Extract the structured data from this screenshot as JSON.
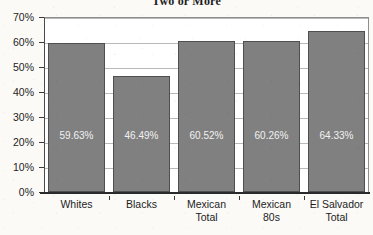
{
  "chart_data": {
    "type": "bar",
    "title": "Two or More",
    "xlabel": "",
    "ylabel": "",
    "ylim": [
      0,
      70
    ],
    "ytick_labels": [
      "0%",
      "10%",
      "20%",
      "30%",
      "40%",
      "50%",
      "60%",
      "70%"
    ],
    "ytick_values": [
      0,
      10,
      20,
      30,
      40,
      50,
      60,
      70
    ],
    "grid": true,
    "legend": false,
    "bar_color": "#808080",
    "bar_border_color": "#4f4f4f",
    "value_label_color": "#f2f2f2",
    "categories": [
      "Whites",
      "Blacks",
      "Mexican Total",
      "Mexican 80s",
      "El Salvador Total"
    ],
    "category_lines": [
      [
        "Whites"
      ],
      [
        "Blacks"
      ],
      [
        "Mexican",
        "Total"
      ],
      [
        "Mexican",
        "80s"
      ],
      [
        "El Salvador",
        "Total"
      ]
    ],
    "values": [
      59.63,
      46.49,
      60.52,
      60.26,
      64.33
    ],
    "value_labels": [
      "59.63%",
      "46.49%",
      "60.52%",
      "60.26%",
      "64.33%"
    ]
  }
}
